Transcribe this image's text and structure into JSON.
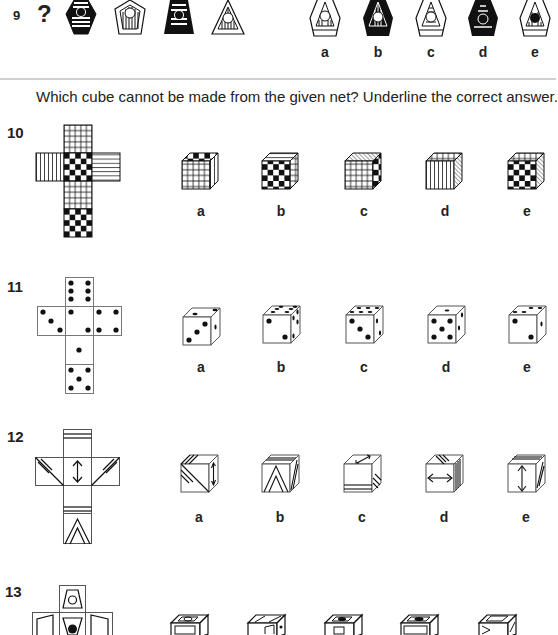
{
  "question9": {
    "number": "9",
    "missing_marker": "?",
    "sequence_shapes": [
      "hexagon-black-striped-dot",
      "pentagon-vertical-stripes-circle",
      "trapezoid-black-striped-dot",
      "triangle-vertical-stripes-circle"
    ],
    "options": [
      {
        "label": "a"
      },
      {
        "label": "b"
      },
      {
        "label": "c"
      },
      {
        "label": "d"
      },
      {
        "label": "e"
      }
    ]
  },
  "instruction": "Which cube cannot be made from the given net? Underline the correct answer.",
  "question10": {
    "number": "10",
    "net_faces": [
      "grid",
      "checkerboard",
      "vertical-stripes",
      "horizontal-stripes",
      "grid",
      "checkerboard"
    ],
    "options": [
      {
        "label": "a"
      },
      {
        "label": "b"
      },
      {
        "label": "c"
      },
      {
        "label": "d"
      },
      {
        "label": "e"
      }
    ]
  },
  "question11": {
    "number": "11",
    "net_faces": [
      "six",
      "three",
      "two",
      "four",
      "one",
      "five"
    ],
    "options": [
      {
        "label": "a"
      },
      {
        "label": "b"
      },
      {
        "label": "c"
      },
      {
        "label": "d"
      },
      {
        "label": "e"
      }
    ]
  },
  "question12": {
    "number": "12",
    "options": [
      {
        "label": "a"
      },
      {
        "label": "b"
      },
      {
        "label": "c"
      },
      {
        "label": "d"
      },
      {
        "label": "e"
      }
    ]
  },
  "question13": {
    "number": "13"
  }
}
